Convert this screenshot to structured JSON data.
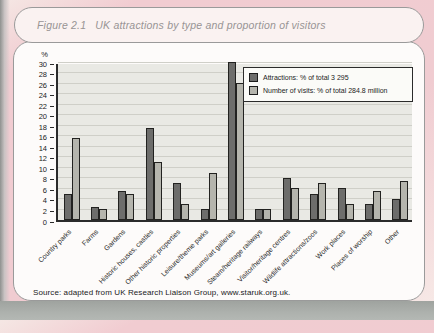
{
  "figure": {
    "label": "Figure 2.1",
    "title": "UK attractions by type and proportion of visitors",
    "source": "Source: adapted from UK Research Liaison Group, www.staruk.org.uk."
  },
  "colors": {
    "page_pink": "#f0ccd1",
    "bottom_band": "#a9ada9",
    "box_background": "#fdfbfa",
    "box_border": "#9a9a9a",
    "plot_background": "#e9e9e4",
    "gridline": "#cfcfc8",
    "axis": "#2b2b2b",
    "attractions_bar": "#6d6d6b",
    "visits_bar": "#b5b5ad"
  },
  "chart_data": {
    "type": "bar",
    "title": "",
    "xlabel": "",
    "ylabel": "%",
    "ylim": [
      0,
      30
    ],
    "ytick_step": 2,
    "grid": true,
    "legend_position": "top-right",
    "categories": [
      "Country parks",
      "Farms",
      "Gardens",
      "Historic houses, castles",
      "Other historic properties",
      "Leisure/theme parks",
      "Museums/art galleries",
      "Steam/heritage railways",
      "Visitor/heritage centres",
      "Wildlife attractions/zoos",
      "Work places",
      "Places of worship",
      "Other"
    ],
    "series": [
      {
        "name": "Attractions: % of total 3 295",
        "color": "#6d6d6b",
        "values": [
          5,
          2.5,
          5.5,
          17.5,
          7,
          2,
          30,
          2,
          8,
          5,
          6,
          3,
          4
        ]
      },
      {
        "name": "Number of visits: % of total 284.8 million",
        "color": "#b5b5ad",
        "values": [
          15.5,
          2,
          5,
          11,
          3,
          9,
          26,
          2,
          6,
          7,
          3,
          5.5,
          7.5
        ]
      }
    ]
  }
}
